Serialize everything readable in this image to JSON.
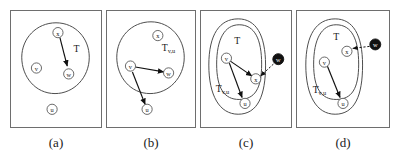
{
  "figure": {
    "type": "diagram",
    "background_color": "#ffffff",
    "line_color": "#4a4a4a",
    "edge_color": "#111111",
    "filled_node_color": "#111111"
  },
  "panels": [
    {
      "id": "a",
      "caption": "(a)",
      "regions": [
        {
          "name": "T",
          "label": "T",
          "subscript": ""
        }
      ],
      "nodes": [
        {
          "id": "x",
          "label": "x",
          "filled": false,
          "inside": "T"
        },
        {
          "id": "v",
          "label": "v",
          "filled": false,
          "inside": "T"
        },
        {
          "id": "w",
          "label": "w",
          "filled": false,
          "inside": "T"
        },
        {
          "id": "u",
          "label": "u",
          "filled": false,
          "inside": "outside"
        }
      ],
      "edges": [
        {
          "from": "x",
          "to": "w",
          "style": "solid",
          "arrow": true
        }
      ]
    },
    {
      "id": "b",
      "caption": "(b)",
      "regions": [
        {
          "name": "T_vu",
          "label": "T",
          "subscript": "v,u"
        }
      ],
      "nodes": [
        {
          "id": "x",
          "label": "x",
          "filled": false,
          "inside": "T_vu"
        },
        {
          "id": "v",
          "label": "v",
          "filled": false,
          "inside": "T_vu"
        },
        {
          "id": "w",
          "label": "w",
          "filled": false,
          "inside": "T_vu"
        },
        {
          "id": "u",
          "label": "u",
          "filled": false,
          "inside": "outside"
        }
      ],
      "edges": [
        {
          "from": "v",
          "to": "w",
          "style": "solid",
          "arrow": true
        },
        {
          "from": "v",
          "to": "u",
          "style": "solid",
          "arrow": true
        }
      ]
    },
    {
      "id": "c",
      "caption": "(c)",
      "regions": [
        {
          "name": "T",
          "label": "T",
          "subscript": ""
        },
        {
          "name": "T_vu",
          "label": "T",
          "subscript": "v,u"
        }
      ],
      "nodes": [
        {
          "id": "v",
          "label": "v",
          "filled": false,
          "inside": "T"
        },
        {
          "id": "x",
          "label": "x",
          "filled": false,
          "inside": "T"
        },
        {
          "id": "u",
          "label": "u",
          "filled": false,
          "inside": "T_vu"
        },
        {
          "id": "w",
          "label": "w",
          "filled": true,
          "inside": "outside"
        }
      ],
      "edges": [
        {
          "from": "v",
          "to": "x",
          "style": "solid",
          "arrow": true
        },
        {
          "from": "v",
          "to": "u",
          "style": "solid",
          "arrow": true
        },
        {
          "from": "w",
          "to": "x",
          "style": "dashed",
          "arrow": true
        }
      ]
    },
    {
      "id": "d",
      "caption": "(d)",
      "regions": [
        {
          "name": "T",
          "label": "T",
          "subscript": ""
        },
        {
          "name": "T_vu",
          "label": "T",
          "subscript": "v,u"
        }
      ],
      "nodes": [
        {
          "id": "x",
          "label": "x",
          "filled": false,
          "inside": "T"
        },
        {
          "id": "v",
          "label": "v",
          "filled": false,
          "inside": "T"
        },
        {
          "id": "u",
          "label": "u",
          "filled": false,
          "inside": "T_vu"
        },
        {
          "id": "w",
          "label": "w",
          "filled": true,
          "inside": "outside"
        }
      ],
      "edges": [
        {
          "from": "v",
          "to": "u",
          "style": "solid",
          "arrow": true
        },
        {
          "from": "w",
          "to": "x",
          "style": "dashed",
          "arrow": true
        }
      ]
    }
  ]
}
